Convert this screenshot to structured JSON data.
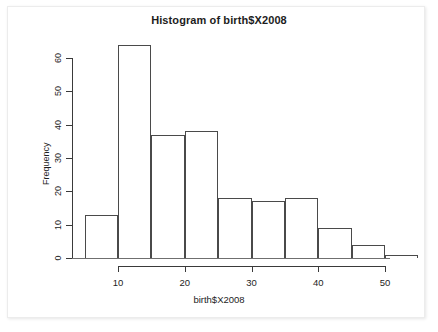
{
  "chart_data": {
    "type": "bar",
    "title": "Histogram of birth$X2008",
    "xlabel": "birth$X2008",
    "ylabel": "Frequency",
    "grid": false,
    "legend": null,
    "xlim": [
      5,
      55
    ],
    "ylim": [
      0,
      64
    ],
    "bin_width": 5,
    "bin_edges": [
      5,
      10,
      15,
      20,
      25,
      30,
      35,
      40,
      45,
      50,
      55
    ],
    "categories": [
      "5-10",
      "10-15",
      "15-20",
      "20-25",
      "25-30",
      "30-35",
      "35-40",
      "40-45",
      "45-50",
      "50-55"
    ],
    "values": [
      13,
      64,
      37,
      38,
      18,
      17,
      18,
      9,
      4,
      1
    ],
    "x_ticks": [
      10,
      20,
      30,
      40,
      50
    ],
    "x_tick_labels": [
      "10",
      "20",
      "30",
      "40",
      "50"
    ],
    "y_ticks": [
      0,
      10,
      20,
      30,
      40,
      50,
      60
    ],
    "y_tick_labels": [
      "0",
      "10",
      "20",
      "30",
      "40",
      "50",
      "60"
    ],
    "axis_color": "#3a3a3a",
    "bar_border_color": "#4a4a4a",
    "bar_fill_color": "transparent",
    "background_color": "#ffffff"
  }
}
